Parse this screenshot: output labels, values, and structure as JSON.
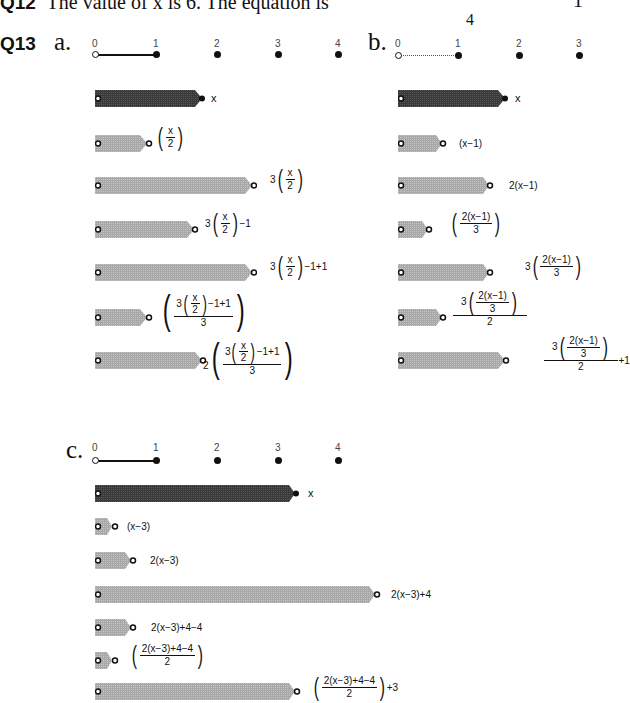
{
  "q12": {
    "label": "Q12",
    "text": "The value of x is 6. The equation is",
    "frac_denominator": "4",
    "rhs": "1"
  },
  "q13": {
    "label": "Q13",
    "parts": [
      {
        "letter": "a.",
        "number_line": {
          "ticks": [
            "0",
            "1",
            "2",
            "3",
            "4"
          ],
          "segment": "0-1 solid"
        },
        "rows": [
          {
            "expr": "x",
            "value": 1.75,
            "shade": "dark"
          },
          {
            "expr": "(x/2)",
            "value": 0.875
          },
          {
            "expr": "3(x/2)",
            "value": 2.625
          },
          {
            "expr": "3(x/2)−1",
            "value": 1.625
          },
          {
            "expr": "3(x/2)−1+1",
            "value": 2.625
          },
          {
            "expr": "(3(x/2)−1+1)/3",
            "value": 0.875
          },
          {
            "expr": "2((3(x/2)−1+1)/3)",
            "value": 1.75
          }
        ]
      },
      {
        "letter": "b.",
        "number_line": {
          "ticks": [
            "0",
            "1",
            "2",
            "3"
          ],
          "segment": "0-1 dotted"
        },
        "rows": [
          {
            "expr": "x",
            "value": 1.75,
            "shade": "dark"
          },
          {
            "expr": "(x−1)",
            "value": 0.75
          },
          {
            "expr": "2(x−1)",
            "value": 1.5
          },
          {
            "expr": "(2(x−1)/3)",
            "value": 0.5
          },
          {
            "expr": "3(2(x−1)/3)",
            "value": 1.5
          },
          {
            "expr": "3(2(x−1)/3)/2",
            "value": 0.75
          },
          {
            "expr": "3(2(x−1)/3)/2+1",
            "value": 1.75
          }
        ]
      },
      {
        "letter": "c.",
        "number_line": {
          "ticks": [
            "0",
            "1",
            "2",
            "3",
            "4"
          ],
          "segment": "0-1 solid"
        },
        "rows": [
          {
            "expr": "x",
            "value": 3.3,
            "shade": "dark"
          },
          {
            "expr": "(x−3)",
            "value": 0.3
          },
          {
            "expr": "2(x−3)",
            "value": 0.6
          },
          {
            "expr": "2(x−3)+4",
            "value": 4.6
          },
          {
            "expr": "2(x−3)+4−4",
            "value": 0.6
          },
          {
            "expr": "(2(x−3)+4−4)/2",
            "value": 0.3
          },
          {
            "expr": "((2(x−3)+4−4)/2)+3",
            "value": 3.3
          }
        ]
      }
    ]
  },
  "text": {
    "x": "x",
    "two": "2",
    "three": "3",
    "n3": "3(",
    "n2": "2(",
    "m1": "−1",
    "m1p1": "−1+1",
    "xm1": "(x−1)",
    "twoxm1": "2(x−1)",
    "twoxm1_num": "2(x−1)",
    "xm3": "(x−3)",
    "twoxm3": "2(x−3)",
    "twoxm3p4": "2(x−3)+4",
    "twoxm3p4m4": "2(x−3)+4−4",
    "p1": "+1",
    "p3": "+3"
  },
  "colors": {
    "bar_dark": "#3a3a3a",
    "bar_light": "#a8a8a8",
    "ink": "#111111"
  }
}
